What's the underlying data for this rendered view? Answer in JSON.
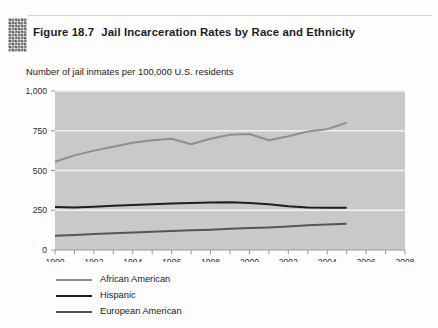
{
  "figure": {
    "icon": "textured-block-icon",
    "number_label": "Figure 18.7",
    "title": "Jail Incarceration Rates by Race and Ethnicity",
    "subtitle": "Number of jail inmates per 100,000 U.S. residents"
  },
  "colors": {
    "plot_background": "#c9c9c9",
    "gridline": "#f2f2f2",
    "african_american": "#8f8f8f",
    "hispanic": "#1e1e1e",
    "european_american": "#555555",
    "axis": "#9a9a9a",
    "text": "#2c2c2c"
  },
  "chart_data": {
    "type": "line",
    "title": "Jail Incarceration Rates by Race and Ethnicity",
    "subtitle": "Number of jail inmates per 100,000 U.S. residents",
    "xlabel": "",
    "ylabel": "Number of jail inmates per 100,000 U.S. residents",
    "xlim": [
      1990,
      2008
    ],
    "ylim": [
      0,
      1000
    ],
    "xticks": [
      1990,
      1992,
      1994,
      1996,
      1998,
      2000,
      2002,
      2004,
      2006,
      2008
    ],
    "xtick_labels": [
      "1990",
      "1992",
      "1994",
      "1996",
      "1998",
      "2000",
      "2002",
      "2004",
      "2006",
      "2008"
    ],
    "yticks": [
      0,
      250,
      500,
      750,
      1000
    ],
    "ytick_labels": [
      "0",
      "250",
      "500",
      "750",
      "1,000"
    ],
    "grid": "horizontal",
    "legend_position": "below",
    "x": [
      1990,
      1991,
      1992,
      1993,
      1994,
      1995,
      1996,
      1997,
      1998,
      1999,
      2000,
      2001,
      2002,
      2003,
      2004,
      2005
    ],
    "series": [
      {
        "name": "African American",
        "color": "#8f8f8f",
        "values": [
          555,
          595,
          625,
          650,
          675,
          690,
          700,
          665,
          700,
          725,
          730,
          690,
          715,
          745,
          760,
          800
        ]
      },
      {
        "name": "Hispanic",
        "color": "#1e1e1e",
        "values": [
          270,
          268,
          272,
          278,
          283,
          288,
          292,
          295,
          298,
          300,
          295,
          288,
          275,
          268,
          266,
          265
        ]
      },
      {
        "name": "European American",
        "color": "#555555",
        "values": [
          90,
          95,
          100,
          105,
          110,
          115,
          120,
          124,
          128,
          133,
          138,
          142,
          148,
          155,
          160,
          165
        ]
      }
    ]
  },
  "legend": {
    "items": [
      {
        "label": "African American",
        "color": "#8f8f8f"
      },
      {
        "label": "Hispanic",
        "color": "#1e1e1e"
      },
      {
        "label": "European American",
        "color": "#555555"
      }
    ]
  }
}
